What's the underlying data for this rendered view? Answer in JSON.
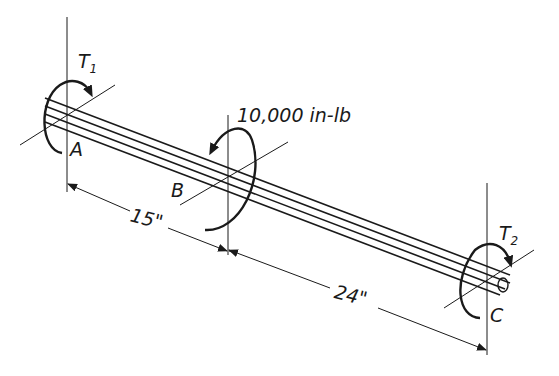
{
  "diagram": {
    "type": "shaft-torsion",
    "labels": {
      "point_a": "A",
      "point_b": "B",
      "point_c": "C",
      "torque_1": "T",
      "torque_1_sub": "1",
      "torque_2": "T",
      "torque_2_sub": "2",
      "applied_torque": "10,000 in-lb",
      "dim_ab": "15\"",
      "dim_bc": "24\""
    },
    "colors": {
      "ink": "#1a1a1a",
      "background": "#ffffff"
    }
  }
}
